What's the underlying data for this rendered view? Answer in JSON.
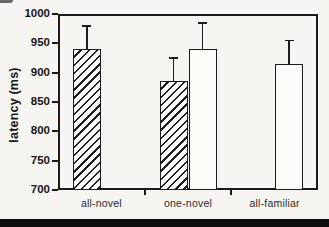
{
  "figure": {
    "background_color": "#f6f5f1",
    "ink_color": "#1a1a1a",
    "bottom_band_color": "#0e0e0e"
  },
  "chart_data": {
    "type": "bar",
    "title": "",
    "xlabel": "",
    "ylabel": "latency (ms)",
    "ylim": [
      700,
      1000
    ],
    "ytick_step": 50,
    "yticks": [
      1000,
      950,
      900,
      850,
      800,
      750,
      700
    ],
    "categories": [
      "all-novel",
      "one-novel",
      "all-familiar"
    ],
    "grid": false,
    "legend": "none",
    "series": [
      {
        "name": "hatched",
        "style": "hatched",
        "values": [
          940,
          885,
          null
        ],
        "error_up": [
          40,
          40,
          null
        ]
      },
      {
        "name": "open",
        "style": "open",
        "values": [
          null,
          940,
          915
        ],
        "error_up": [
          null,
          45,
          40
        ]
      }
    ],
    "bars": [
      {
        "category": "all-novel",
        "slot": "left",
        "style": "hatched",
        "value": 940,
        "error_top": 980
      },
      {
        "category": "one-novel",
        "slot": "left",
        "style": "hatched",
        "value": 885,
        "error_top": 925
      },
      {
        "category": "one-novel",
        "slot": "right",
        "style": "open",
        "value": 940,
        "error_top": 985
      },
      {
        "category": "all-familiar",
        "slot": "right",
        "style": "open",
        "value": 915,
        "error_top": 955
      }
    ]
  }
}
